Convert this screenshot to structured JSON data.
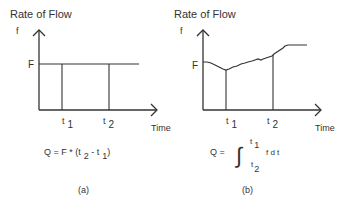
{
  "panels": [
    {
      "id": "a",
      "y_title": "Rate of Flow",
      "y_axis_label": "f",
      "level_label": "F",
      "x_axis_label": "Time",
      "t1_label": "t",
      "t1_sub": "1",
      "t2_label": "t",
      "t2_sub": "2",
      "formula": {
        "lhs": "Q = F * (t",
        "sub1": "2",
        "mid": " - t",
        "sub2": "1",
        "rhs": ")"
      },
      "caption": "(a)",
      "curve_type": "constant"
    },
    {
      "id": "b",
      "y_title": "Rate of Flow",
      "y_axis_label": "f",
      "level_label": "F",
      "x_axis_label": "Time",
      "t1_label": "t",
      "t1_sub": "1",
      "t2_label": "t",
      "t2_sub": "2",
      "formula": {
        "lhs": "Q =",
        "integral": "∫",
        "upper_t": "t",
        "upper_sub": "1",
        "lower_t": "t",
        "lower_sub": "2",
        "integrand": "f d t"
      },
      "caption": "(b)",
      "curve_type": "variable"
    }
  ],
  "colors": {
    "line": "#333333",
    "text": "#333333"
  }
}
